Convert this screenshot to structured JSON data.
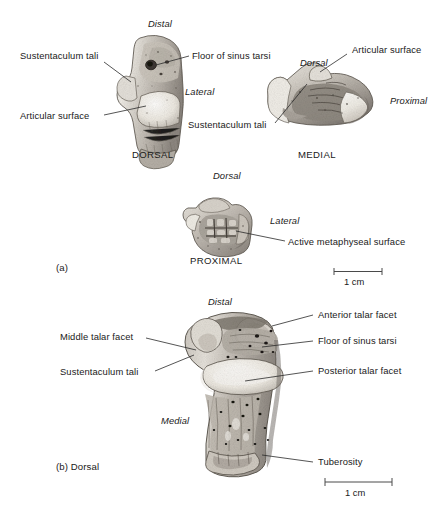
{
  "figure": {
    "background": "#ffffff",
    "ink": "#1a1a1a"
  },
  "panels": [
    {
      "id": "a",
      "panel_label": "(a)",
      "views": [
        {
          "id": "dorsal",
          "caption": "DORSAL",
          "orientation_labels": [
            {
              "text": "Distal",
              "style": "italic"
            },
            {
              "text": "Lateral",
              "style": "italic"
            }
          ],
          "callouts": [
            {
              "text": "Sustentaculum tali",
              "side": "left"
            },
            {
              "text": "Articular surface",
              "side": "left"
            },
            {
              "text": "Floor of sinus tarsi",
              "side": "right"
            }
          ]
        },
        {
          "id": "medial",
          "caption": "MEDIAL",
          "orientation_labels": [
            {
              "text": "Dorsal",
              "style": "italic"
            },
            {
              "text": "Proximal",
              "style": "italic"
            }
          ],
          "callouts": [
            {
              "text": "Articular surface",
              "side": "right"
            },
            {
              "text": "Sustentaculum tali",
              "side": "below"
            }
          ]
        },
        {
          "id": "proximal",
          "caption": "PROXIMAL",
          "orientation_labels": [
            {
              "text": "Dorsal",
              "style": "italic"
            },
            {
              "text": "Lateral",
              "style": "italic"
            }
          ],
          "callouts": [
            {
              "text": "Active metaphyseal surface",
              "side": "right"
            }
          ]
        }
      ],
      "scale_bar": {
        "label": "1 cm"
      }
    },
    {
      "id": "b",
      "panel_label": "(b) Dorsal",
      "views": [
        {
          "id": "dorsal-large",
          "caption": "",
          "orientation_labels": [
            {
              "text": "Distal",
              "style": "italic"
            },
            {
              "text": "Medial",
              "style": "italic"
            }
          ],
          "callouts": [
            {
              "text": "Anterior talar facet",
              "side": "right"
            },
            {
              "text": "Floor of sinus tarsi",
              "side": "right"
            },
            {
              "text": "Posterior talar facet",
              "side": "right"
            },
            {
              "text": "Tuberosity",
              "side": "right"
            },
            {
              "text": "Middle talar facet",
              "side": "left"
            },
            {
              "text": "Sustentaculum tali",
              "side": "left"
            }
          ]
        }
      ],
      "scale_bar": {
        "label": "1 cm"
      }
    }
  ],
  "text": {
    "distal_a": "Distal",
    "lateral_a": "Lateral",
    "sustentaculum_tali_a_left": "Sustentaculum tali",
    "articular_surface_a_left": "Articular surface",
    "floor_sinus_tarsi_a": "Floor of sinus tarsi",
    "dorsal_caption": "DORSAL",
    "dorsal_medial_ital": "Dorsal",
    "articular_surface_medial": "Articular surface",
    "proximal_ital": "Proximal",
    "sustentaculum_tali_medial": "Sustentaculum tali",
    "medial_caption": "MEDIAL",
    "dorsal_proximal_ital": "Dorsal",
    "lateral_proximal_ital": "Lateral",
    "active_metaphyseal_surface": "Active metaphyseal surface",
    "proximal_caption": "PROXIMAL",
    "panel_a": "(a)",
    "scale_a": "1 cm",
    "distal_b": "Distal",
    "anterior_talar_facet": "Anterior talar facet",
    "floor_sinus_tarsi_b": "Floor of sinus tarsi",
    "posterior_talar_facet": "Posterior talar facet",
    "middle_talar_facet": "Middle talar facet",
    "sustentaculum_tali_b": "Sustentaculum tali",
    "medial_b": "Medial",
    "tuberosity": "Tuberosity",
    "panel_b": "(b) Dorsal",
    "scale_b": "1 cm"
  }
}
